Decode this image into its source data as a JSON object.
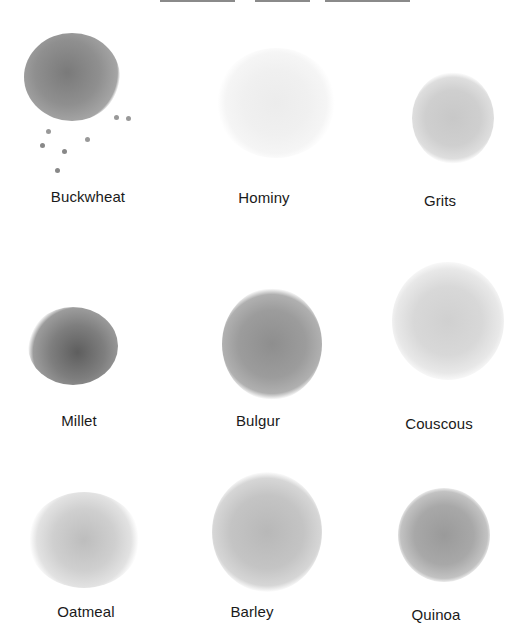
{
  "title": {
    "visible": "partially clipped at top edge"
  },
  "grains": [
    {
      "name": "Buckwheat",
      "tone": "#8f8f8f",
      "dark": "#5e5e5e",
      "texture": "coarse round kernels"
    },
    {
      "name": "Hominy",
      "tone": "#f4f4f4",
      "dark": "#dcdcdc",
      "texture": "large white puffed kernels"
    },
    {
      "name": "Grits",
      "tone": "#cfcfcf",
      "dark": "#b4b4b4",
      "texture": "fine powder"
    },
    {
      "name": "Millet",
      "tone": "#8a8a8a",
      "dark": "#555555",
      "texture": "small round beads"
    },
    {
      "name": "Bulgur",
      "tone": "#9c9c9c",
      "dark": "#747474",
      "texture": "cracked fine"
    },
    {
      "name": "Couscous",
      "tone": "#dadada",
      "dark": "#c2c2c2",
      "texture": "fine scattered granules"
    },
    {
      "name": "Oatmeal",
      "tone": "#d6d6d6",
      "dark": "#a9a9a9",
      "texture": "flaked"
    },
    {
      "name": "Barley",
      "tone": "#c4c4c4",
      "dark": "#a0a0a0",
      "texture": "oval pearled grains"
    },
    {
      "name": "Quinoa",
      "tone": "#a8a8a8",
      "dark": "#7c7c7c",
      "texture": "fine speckled"
    }
  ]
}
